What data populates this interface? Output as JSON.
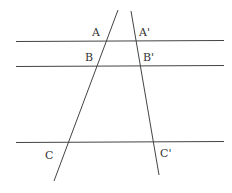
{
  "diagram": {
    "type": "geometry-parallel-lines-transversals",
    "stroke_color": "#444444",
    "label_color": "#333333",
    "parallel_lines": [
      {
        "id": "line-1",
        "x1": 16,
        "y1": 41.5,
        "x2": 224,
        "y2": 40.5
      },
      {
        "id": "line-2",
        "x1": 16,
        "y1": 66.5,
        "x2": 224,
        "y2": 65.5
      },
      {
        "id": "line-3",
        "x1": 16,
        "y1": 142.5,
        "x2": 224,
        "y2": 141.5
      }
    ],
    "transversals": [
      {
        "id": "transversal-left",
        "x1": 118,
        "y1": 10,
        "x2": 54,
        "y2": 181
      },
      {
        "id": "transversal-right",
        "x1": 131,
        "y1": 11,
        "x2": 159,
        "y2": 175
      }
    ],
    "labels": [
      {
        "id": "A",
        "text": "A",
        "x": 92,
        "y": 36
      },
      {
        "id": "A-prime",
        "text": "A'",
        "x": 139,
        "y": 36
      },
      {
        "id": "B",
        "text": "B",
        "x": 85,
        "y": 61
      },
      {
        "id": "B-prime",
        "text": "B'",
        "x": 143,
        "y": 61
      },
      {
        "id": "C",
        "text": "C",
        "x": 45,
        "y": 159
      },
      {
        "id": "C-prime",
        "text": "C'",
        "x": 160,
        "y": 157
      }
    ]
  }
}
